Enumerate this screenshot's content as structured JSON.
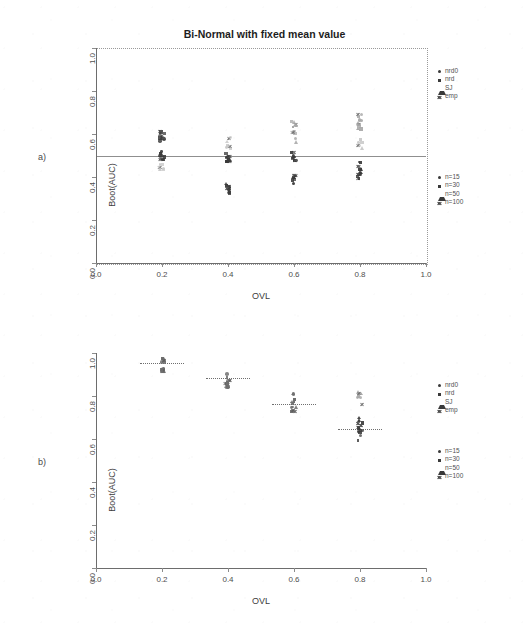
{
  "figure": {
    "panels": [
      {
        "id": "a",
        "label": "a)",
        "title": "Bi-Normal with fixed mean value",
        "xlabel": "OVL",
        "ylabel": "Boot(AUC)"
      },
      {
        "id": "b",
        "label": "b)",
        "title": "Bi-Normal with standard deviation fixed",
        "xlabel": "OVL",
        "ylabel": "Boot(AUC)"
      }
    ]
  },
  "axes": {
    "x_ticks": [
      "0.0",
      "0.2",
      "0.4",
      "0.6",
      "0.8",
      "1.0"
    ],
    "y_ticks": [
      "0.0",
      "0.2",
      "0.4",
      "0.6",
      "0.8",
      "1.0"
    ],
    "xlim": [
      0.0,
      1.0
    ],
    "ylim": [
      0.0,
      1.0
    ]
  },
  "legends": {
    "estimator": {
      "items": [
        {
          "label": "nrd0",
          "glyph": "circle"
        },
        {
          "label": "nrd",
          "glyph": "square"
        },
        {
          "label": "SJ",
          "glyph": "triangle"
        },
        {
          "label": "emp",
          "glyph": "cross"
        }
      ]
    },
    "sample_size": {
      "items": [
        {
          "label": "n=15",
          "glyph": "circle"
        },
        {
          "label": "n=30",
          "glyph": "square"
        },
        {
          "label": "n=50",
          "glyph": "triangle"
        },
        {
          "label": "n=100",
          "glyph": "cross"
        }
      ]
    }
  },
  "colors": {
    "ink": "#2b2b2b",
    "axis": "#6d6d6d",
    "grid": "#9a9a9a",
    "point_dark": "#3a3a3a",
    "point_mid": "#6e6e6e",
    "point_light": "#a8a8a8",
    "point_faint": "#c9c9c9"
  },
  "chart_data": [
    {
      "type": "scatter",
      "panel": "a",
      "title": "Bi-Normal with fixed mean value",
      "xlabel": "OVL",
      "ylabel": "Boot(AUC)",
      "xlim": [
        0.0,
        1.0
      ],
      "ylim": [
        0.0,
        1.0
      ],
      "grid": false,
      "legend_position": "right",
      "reference_line_y": 0.5,
      "x": [
        0.2,
        0.4,
        0.6,
        0.8
      ],
      "clusters": [
        {
          "x": 0.2,
          "center_y": 0.6,
          "spread": 0.035,
          "shade": "dark",
          "n": 10
        },
        {
          "x": 0.2,
          "center_y": 0.5,
          "spread": 0.022,
          "shade": "dark",
          "n": 10
        },
        {
          "x": 0.2,
          "center_y": 0.45,
          "spread": 0.02,
          "shade": "faint",
          "n": 7
        },
        {
          "x": 0.4,
          "center_y": 0.56,
          "spread": 0.03,
          "shade": "faint",
          "n": 8
        },
        {
          "x": 0.4,
          "center_y": 0.49,
          "spread": 0.022,
          "shade": "dark",
          "n": 10
        },
        {
          "x": 0.4,
          "center_y": 0.345,
          "spread": 0.022,
          "shade": "dark",
          "n": 10
        },
        {
          "x": 0.6,
          "center_y": 0.615,
          "spread": 0.055,
          "shade": "light",
          "n": 11
        },
        {
          "x": 0.6,
          "center_y": 0.495,
          "spread": 0.022,
          "shade": "dark",
          "n": 10
        },
        {
          "x": 0.6,
          "center_y": 0.385,
          "spread": 0.025,
          "shade": "dark",
          "n": 9
        },
        {
          "x": 0.8,
          "center_y": 0.655,
          "spread": 0.045,
          "shade": "light",
          "n": 10
        },
        {
          "x": 0.8,
          "center_y": 0.555,
          "spread": 0.02,
          "shade": "faint",
          "n": 6
        },
        {
          "x": 0.8,
          "center_y": 0.435,
          "spread": 0.045,
          "shade": "dark",
          "n": 14
        }
      ],
      "series": [
        {
          "name": "nrd0",
          "values": [
            0.6,
            0.49,
            0.5,
            0.44
          ]
        },
        {
          "name": "nrd",
          "values": [
            0.5,
            0.35,
            0.39,
            0.43
          ]
        },
        {
          "name": "SJ",
          "values": [
            0.45,
            0.56,
            0.62,
            0.66
          ]
        },
        {
          "name": "emp",
          "values": [
            0.5,
            0.49,
            0.5,
            0.46
          ]
        }
      ]
    },
    {
      "type": "scatter",
      "panel": "b",
      "title": "Bi-Normal with standard deviation fixed",
      "xlabel": "OVL",
      "ylabel": "Boot(AUC)",
      "xlim": [
        0.0,
        1.0
      ],
      "ylim": [
        0.0,
        1.0
      ],
      "grid": false,
      "legend_position": "right",
      "x": [
        0.2,
        0.4,
        0.6,
        0.8
      ],
      "mean_markers": [
        0.955,
        0.885,
        0.765,
        0.645
      ],
      "clusters": [
        {
          "x": 0.2,
          "center_y": 0.955,
          "spread": 0.045,
          "shade": "mid",
          "n": 14
        },
        {
          "x": 0.4,
          "center_y": 0.885,
          "spread": 0.048,
          "shade": "mid",
          "n": 14
        },
        {
          "x": 0.6,
          "center_y": 0.77,
          "spread": 0.05,
          "shade": "mid",
          "n": 13
        },
        {
          "x": 0.8,
          "center_y": 0.79,
          "spread": 0.035,
          "shade": "light",
          "n": 8
        },
        {
          "x": 0.8,
          "center_y": 0.645,
          "spread": 0.055,
          "shade": "dark",
          "n": 14
        }
      ],
      "series": [
        {
          "name": "nrd0",
          "values": [
            0.955,
            0.885,
            0.77,
            0.645
          ]
        },
        {
          "name": "nrd",
          "values": [
            0.95,
            0.88,
            0.76,
            0.64
          ]
        },
        {
          "name": "SJ",
          "values": [
            0.965,
            0.895,
            0.78,
            0.79
          ]
        },
        {
          "name": "emp",
          "values": [
            0.945,
            0.875,
            0.755,
            0.65
          ]
        }
      ]
    }
  ]
}
